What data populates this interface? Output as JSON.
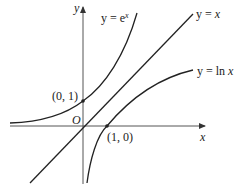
{
  "diagram": {
    "axes": {
      "x_label": "x",
      "y_label": "y",
      "origin_label": "O"
    },
    "curves": [
      {
        "id": "exp",
        "label_lhs": "y = e",
        "label_sup": "x",
        "function": "e^x"
      },
      {
        "id": "identity",
        "label_lhs": "y = ",
        "label_var": "x",
        "function": "x"
      },
      {
        "id": "log",
        "label_lhs": "y = ln ",
        "label_var": "x",
        "function": "ln x"
      }
    ],
    "points": [
      {
        "label": "(0, 1)",
        "x": 0,
        "y": 1
      },
      {
        "label": "(1, 0)",
        "x": 1,
        "y": 0
      }
    ],
    "colors": {
      "stroke": "#222222",
      "background": "#ffffff"
    }
  }
}
